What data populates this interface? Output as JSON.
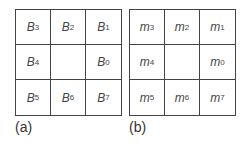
{
  "panels": [
    {
      "caption": "(a)",
      "cells": [
        {
          "base": "B",
          "sub": "3"
        },
        {
          "base": "B",
          "sub": "2"
        },
        {
          "base": "B",
          "sub": "1"
        },
        {
          "base": "B",
          "sub": "4"
        },
        {
          "base": "",
          "sub": ""
        },
        {
          "base": "B",
          "sub": "0"
        },
        {
          "base": "B",
          "sub": "5"
        },
        {
          "base": "B",
          "sub": "6"
        },
        {
          "base": "B",
          "sub": "7"
        }
      ]
    },
    {
      "caption": "(b)",
      "cells": [
        {
          "base": "m",
          "sub": "3"
        },
        {
          "base": "m",
          "sub": "2"
        },
        {
          "base": "m",
          "sub": "1"
        },
        {
          "base": "m",
          "sub": "4"
        },
        {
          "base": "",
          "sub": ""
        },
        {
          "base": "m",
          "sub": "0"
        },
        {
          "base": "m",
          "sub": "5"
        },
        {
          "base": "m",
          "sub": "6"
        },
        {
          "base": "m",
          "sub": "7"
        }
      ]
    }
  ]
}
